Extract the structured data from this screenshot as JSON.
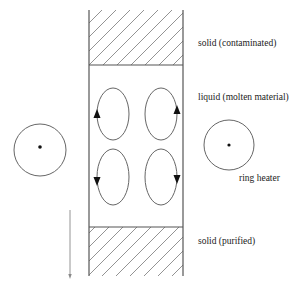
{
  "diagram": {
    "labels": {
      "solid_top": "solid (contaminated)",
      "liquid": "liquid (molten material)",
      "heater": "ring heater",
      "solid_bottom": "solid (purified)"
    },
    "column": {
      "x_left": 89,
      "x_right": 183,
      "top": 10,
      "solid_top_bottom": 65,
      "solid_bottom_top": 227,
      "bottom": 276
    },
    "convection_cells": [
      {
        "position": "top-left",
        "cx": 113,
        "cy": 114,
        "rx": 16,
        "ry": 26,
        "arrow_side": "left",
        "arrow_direction": "up"
      },
      {
        "position": "top-right",
        "cx": 161,
        "cy": 114,
        "rx": 16,
        "ry": 26,
        "arrow_side": "right",
        "arrow_direction": "up"
      },
      {
        "position": "bottom-left",
        "cx": 113,
        "cy": 177,
        "rx": 16,
        "ry": 28,
        "arrow_side": "left",
        "arrow_direction": "down"
      },
      {
        "position": "bottom-right",
        "cx": 161,
        "cy": 177,
        "rx": 16,
        "ry": 28,
        "arrow_side": "right",
        "arrow_direction": "down"
      }
    ],
    "heaters": [
      {
        "side": "left",
        "cx": 40,
        "cy": 150,
        "r": 26
      },
      {
        "side": "right",
        "cx": 229,
        "cy": 145,
        "r": 25
      }
    ],
    "motion_arrow": {
      "x": 70,
      "y_start": 210,
      "y_end": 278,
      "direction": "down"
    },
    "colors": {
      "line": "#555555",
      "hatch": "#777777",
      "text": "#222222",
      "fill": "#111111"
    }
  }
}
